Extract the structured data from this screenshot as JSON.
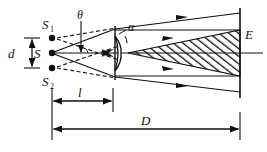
{
  "figure": {
    "background_color": "#ffffff",
    "line_color": "#111111",
    "hatch_color": "#111111"
  },
  "labels": {
    "source_top": "S",
    "source_top_sub": "1",
    "source_mid": "S",
    "source_bottom": "S",
    "source_bottom_sub": "2",
    "separation": "d",
    "angle_theta": "θ",
    "angle_alpha": "α",
    "screen": "E",
    "distance_l": "l",
    "distance_D": "D"
  },
  "geometry": {
    "sources": [
      {
        "name": "S1",
        "x": 52,
        "y": 38
      },
      {
        "name": "S",
        "x": 52,
        "y": 53
      },
      {
        "name": "S2",
        "x": 52,
        "y": 68
      }
    ],
    "biprism_x": 115,
    "screen_x": 240,
    "axis_y": 53,
    "overlap_apex_x": 128,
    "dim_l": {
      "from": 52,
      "to": 113,
      "y": 101
    },
    "dim_D": {
      "from": 52,
      "to": 240,
      "y": 129
    },
    "dim_d": {
      "x": 30,
      "from_y": 38,
      "to_y": 68
    }
  }
}
